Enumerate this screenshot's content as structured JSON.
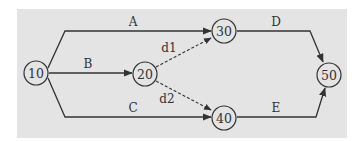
{
  "diagram": {
    "type": "activity-on-arrow network",
    "colors": {
      "background": "#e4e4e4",
      "stroke": "#333333"
    },
    "nodes": [
      {
        "id": "10",
        "label": "10"
      },
      {
        "id": "20",
        "label": "20"
      },
      {
        "id": "30",
        "label": "30"
      },
      {
        "id": "40",
        "label": "40"
      },
      {
        "id": "50",
        "label": "50"
      }
    ],
    "edges": [
      {
        "from": "10",
        "to": "30",
        "label": "A",
        "style": "solid"
      },
      {
        "from": "10",
        "to": "20",
        "label": "B",
        "style": "solid"
      },
      {
        "from": "10",
        "to": "40",
        "label": "C",
        "style": "solid"
      },
      {
        "from": "30",
        "to": "50",
        "label": "D",
        "style": "solid"
      },
      {
        "from": "40",
        "to": "50",
        "label": "E",
        "style": "solid"
      },
      {
        "from": "20",
        "to": "30",
        "label": "d1",
        "style": "dashed"
      },
      {
        "from": "20",
        "to": "40",
        "label": "d2",
        "style": "dashed"
      }
    ]
  }
}
